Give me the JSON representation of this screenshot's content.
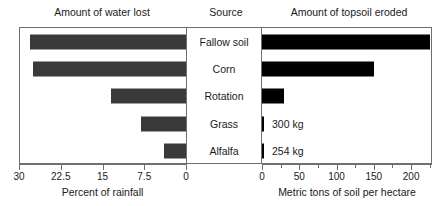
{
  "chart_data": {
    "type": "bar",
    "title": "",
    "orientation": "horizontal",
    "layout": "butterfly-paired-panels",
    "categories": [
      "Fallow soil",
      "Corn",
      "Rotation",
      "Grass",
      "Alfalfa"
    ],
    "panels": [
      {
        "id": "water-lost",
        "header": "Amount of water lost",
        "xlabel": "Percent of rainfall",
        "values": [
          28,
          27.5,
          13.5,
          8,
          4
        ],
        "xlim": [
          30,
          0
        ],
        "direction": "right-to-left",
        "ticks": [
          30,
          22.5,
          15,
          7.5,
          0
        ],
        "ticklabels": [
          "30",
          "22.5",
          "15",
          "7.5",
          "0"
        ],
        "bar_color": "#3a3a3a",
        "grid": false
      },
      {
        "id": "topsoil-eroded",
        "header": "Amount of topsoil eroded",
        "xlabel": "Metric tons of soil per hectare",
        "values": [
          225,
          150,
          30,
          0.3,
          0.254
        ],
        "xlim": [
          0,
          228
        ],
        "direction": "left-to-right",
        "ticks": [
          0,
          50,
          100,
          150,
          200
        ],
        "ticklabels": [
          "0",
          "50",
          "100",
          "150",
          "200"
        ],
        "minor_ticks": [
          25,
          75,
          125,
          175,
          225
        ],
        "bar_color": "#000000",
        "grid": false,
        "annotations": [
          {
            "category": "Grass",
            "text": "300 kg"
          },
          {
            "category": "Alfalfa",
            "text": "254 kg"
          }
        ]
      }
    ],
    "center_panel": {
      "header": "Source",
      "labels": [
        "Fallow soil",
        "Corn",
        "Rotation",
        "Grass",
        "Alfalfa"
      ]
    },
    "legend": null
  },
  "headers": {
    "left": "Amount of water lost",
    "middle": "Source",
    "right": "Amount of topsoil eroded"
  },
  "axis_titles": {
    "left": "Percent of rainfall",
    "right": "Metric tons of soil per hectare"
  },
  "rows": [
    {
      "source": "Fallow soil",
      "water": 28,
      "soil": 225,
      "annotation": ""
    },
    {
      "source": "Corn",
      "water": 27.5,
      "soil": 150,
      "annotation": ""
    },
    {
      "source": "Rotation",
      "water": 13.5,
      "soil": 30,
      "annotation": ""
    },
    {
      "source": "Grass",
      "water": 8,
      "soil": 0.3,
      "annotation": "300 kg"
    },
    {
      "source": "Alfalfa",
      "water": 4,
      "soil": 0.254,
      "annotation": "254 kg"
    }
  ],
  "left_ticklabels": [
    "30",
    "22.5",
    "15",
    "7.5",
    "0"
  ],
  "right_ticklabels": [
    "0",
    "50",
    "100",
    "150",
    "200"
  ],
  "colors": {
    "water_bar": "#3a3a3a",
    "soil_bar": "#000000",
    "frame": "#6f6f6f",
    "text": "#1a1a1a",
    "background": "#ffffff"
  }
}
